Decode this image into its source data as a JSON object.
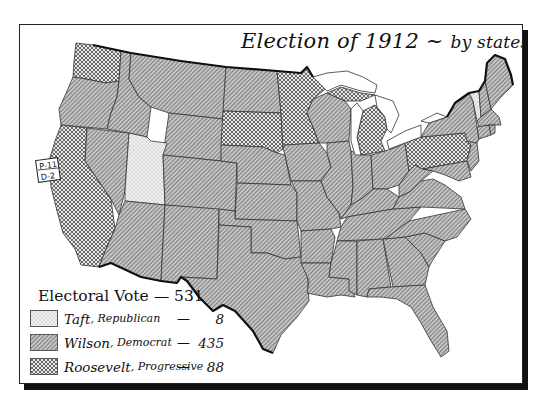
{
  "title": {
    "main": "Election of 1912",
    "dash": "~",
    "sub": "by states"
  },
  "legend": {
    "title": "Electoral Vote",
    "title_dash": "—",
    "total": "531",
    "entries": [
      {
        "candidate": "Taft",
        "party": "Republican",
        "votes": "8",
        "pattern": "dotted",
        "pattern_name": "stipple"
      },
      {
        "candidate": "Wilson",
        "party": "Democrat",
        "votes": "435",
        "pattern": "diagonal-hatch",
        "pattern_name": "fine diagonal lines"
      },
      {
        "candidate": "Roosevelt",
        "party": "Progressive",
        "votes": "88",
        "pattern": "crosshatch",
        "pattern_name": "checkered crosshatch"
      }
    ]
  },
  "split_label": {
    "state": "California",
    "line1": "P-11",
    "line2": "D-2"
  },
  "states": {
    "taft": [
      "Utah",
      "Vermont"
    ],
    "roosevelt": [
      "Washington",
      "California",
      "South Dakota",
      "Minnesota",
      "Michigan",
      "Pennsylvania"
    ],
    "wilson": [
      "Oregon",
      "Idaho",
      "Montana",
      "Wyoming",
      "Nevada",
      "Colorado",
      "Arizona",
      "New Mexico",
      "North Dakota",
      "Nebraska",
      "Kansas",
      "Oklahoma",
      "Texas",
      "Iowa",
      "Missouri",
      "Arkansas",
      "Louisiana",
      "Wisconsin",
      "Illinois",
      "Indiana",
      "Ohio",
      "Kentucky",
      "Tennessee",
      "Mississippi",
      "Alabama",
      "Georgia",
      "Florida",
      "South Carolina",
      "North Carolina",
      "Virginia",
      "West Virginia",
      "Maryland",
      "Delaware",
      "New Jersey",
      "New York",
      "Connecticut",
      "Rhode Island",
      "Massachusetts",
      "New Hampshire",
      "Maine"
    ]
  },
  "colors": {
    "ink": "#111111",
    "wilson_fill": "#9a9a9a",
    "roosevelt_fill": "#b0b0b0",
    "taft_fill": "#e8e8e8",
    "background": "#ffffff"
  }
}
